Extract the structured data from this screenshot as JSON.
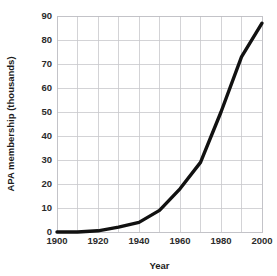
{
  "chart_data": {
    "type": "line",
    "title": "",
    "xlabel": "Year",
    "ylabel": "APA membership (thousands)",
    "xlim": [
      1900,
      2000
    ],
    "ylim": [
      0,
      90
    ],
    "grid": true,
    "legend": false,
    "legend_position": "none",
    "line_color": "#111111",
    "grid_color": "#c8c8cc",
    "background_color": "#ffffff",
    "x_tick_labels": [
      "1900",
      "1920",
      "1940",
      "1960",
      "1980",
      "2000"
    ],
    "x_tick_values": [
      1900,
      1920,
      1940,
      1960,
      1980,
      2000
    ],
    "x_minor_gridlines": [
      1910,
      1930,
      1950,
      1970,
      1990
    ],
    "y_tick_labels": [
      "0",
      "10",
      "20",
      "30",
      "40",
      "50",
      "60",
      "70",
      "80",
      "90"
    ],
    "y_tick_values": [
      0,
      10,
      20,
      30,
      40,
      50,
      60,
      70,
      80,
      90
    ],
    "x": [
      1900,
      1910,
      1920,
      1930,
      1940,
      1950,
      1960,
      1970,
      1980,
      1990,
      2000
    ],
    "values": [
      0,
      0,
      0.5,
      2,
      4,
      9,
      18,
      29,
      50,
      73,
      87
    ],
    "series": [
      {
        "name": "APA membership",
        "x": [
          1900,
          1910,
          1920,
          1930,
          1940,
          1950,
          1960,
          1970,
          1980,
          1990,
          2000
        ],
        "values": [
          0,
          0,
          0.5,
          2,
          4,
          9,
          18,
          29,
          50,
          73,
          87
        ]
      }
    ]
  }
}
